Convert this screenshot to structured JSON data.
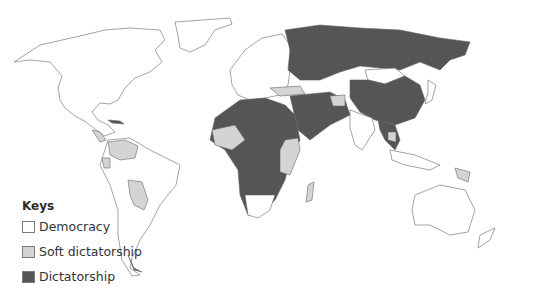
{
  "legend": {
    "title": "Keys",
    "items": [
      {
        "label": "Democracy",
        "color": "#ffffff"
      },
      {
        "label": "Soft dictatorship",
        "color": "#d4d4d4"
      },
      {
        "label": "Dictatorship",
        "color": "#555555"
      }
    ]
  },
  "colors": {
    "democracy": "#ffffff",
    "soft": "#d4d4d4",
    "dictatorship": "#555555",
    "border": "#666666"
  },
  "regions": {
    "democracy": [
      "North America",
      "Greenland",
      "Europe (most)",
      "India",
      "Japan",
      "Mongolia",
      "South Korea",
      "Australia",
      "New Zealand",
      "Brazil",
      "Argentina",
      "Chile",
      "Southern Africa"
    ],
    "soft_dictatorship": [
      "Venezuela",
      "Ecuador",
      "Bolivia",
      "Paraguay",
      "Central America (part)",
      "West Africa (part)",
      "East Africa",
      "Madagascar",
      "Turkey",
      "Afghanistan",
      "Papua New Guinea",
      "Cambodia"
    ],
    "dictatorship": [
      "Russia",
      "China",
      "Central Asia",
      "Iran",
      "Saudi Arabia",
      "North Africa",
      "Central Africa",
      "Southeast Asia (part)",
      "Cuba"
    ]
  }
}
